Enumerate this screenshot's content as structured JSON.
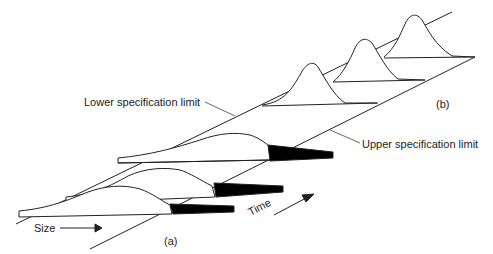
{
  "diagram": {
    "labels": {
      "lower_spec": "Lower specification limit",
      "upper_spec": "Upper specification limit",
      "size_axis": "Size",
      "time_axis": "Time",
      "panel_a": "(a)",
      "panel_b": "(b)"
    },
    "colors": {
      "line": "#222222",
      "fill_out_of_spec": "#000000",
      "background": "#ffffff"
    },
    "panel_a": {
      "distributions": 3,
      "description": "Wide distributions with tails beyond upper specification limit (black shaded)"
    },
    "panel_b": {
      "distributions": 3,
      "description": "Narrow distributions centered within specification limits"
    }
  }
}
